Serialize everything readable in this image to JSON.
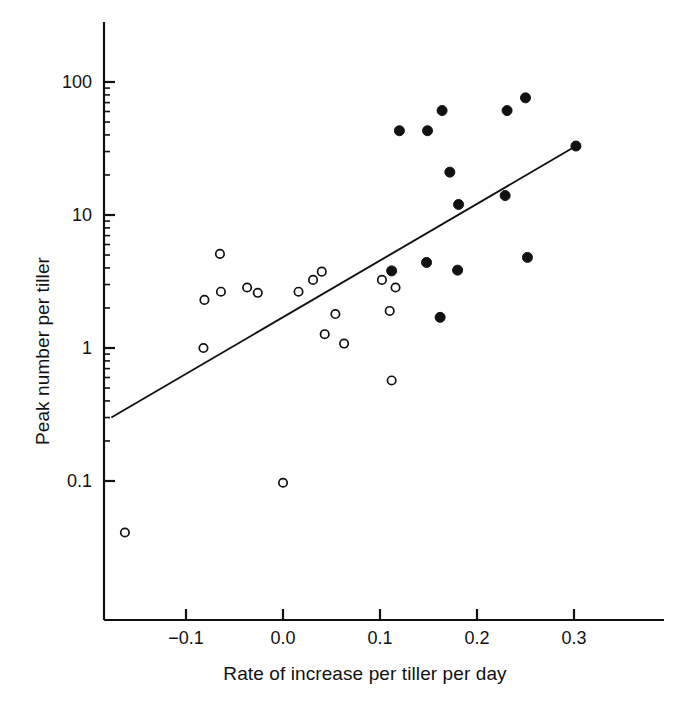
{
  "chart_data": {
    "type": "scatter",
    "title": "",
    "subtitle": "",
    "xlabel": "Rate of increase per tiller per day",
    "ylabel": "Peak number per tiller",
    "xscale": "linear",
    "yscale": "log",
    "xlim": [
      -0.18,
      0.325
    ],
    "ylim": [
      0.025,
      200
    ],
    "grid": false,
    "legend": "none",
    "xticks": [
      -0.1,
      0.0,
      0.1,
      0.2,
      0.3
    ],
    "xticklabels": [
      "−0.1",
      "0.0",
      "0.1",
      "0.2",
      "0.3"
    ],
    "yticks": [
      0.1,
      1,
      10,
      100
    ],
    "yticklabels": [
      "0.1",
      "1",
      "10",
      "100"
    ],
    "yminorticks": [
      0.2,
      0.3,
      0.4,
      0.5,
      0.6,
      0.7,
      0.8,
      0.9,
      2,
      3,
      4,
      5,
      6,
      7,
      8,
      9,
      20,
      30,
      40,
      50,
      60,
      70,
      80,
      90
    ],
    "series": [
      {
        "name": "open circles",
        "marker": "open-circle",
        "color": "#111111",
        "points": [
          {
            "x": -0.163,
            "y": 0.041
          },
          {
            "x": -0.082,
            "y": 1.0
          },
          {
            "x": -0.081,
            "y": 2.3
          },
          {
            "x": -0.065,
            "y": 5.1
          },
          {
            "x": -0.064,
            "y": 2.65
          },
          {
            "x": -0.037,
            "y": 2.85
          },
          {
            "x": -0.026,
            "y": 2.6
          },
          {
            "x": 0.0,
            "y": 0.097
          },
          {
            "x": 0.016,
            "y": 2.65
          },
          {
            "x": 0.031,
            "y": 3.25
          },
          {
            "x": 0.04,
            "y": 3.75
          },
          {
            "x": 0.043,
            "y": 1.27
          },
          {
            "x": 0.054,
            "y": 1.8
          },
          {
            "x": 0.063,
            "y": 1.08
          },
          {
            "x": 0.102,
            "y": 3.25
          },
          {
            "x": 0.11,
            "y": 1.9
          },
          {
            "x": 0.112,
            "y": 0.57
          },
          {
            "x": 0.116,
            "y": 2.85
          }
        ]
      },
      {
        "name": "filled circles",
        "marker": "filled-circle",
        "color": "#111111",
        "points": [
          {
            "x": 0.112,
            "y": 3.8
          },
          {
            "x": 0.12,
            "y": 43.0
          },
          {
            "x": 0.148,
            "y": 4.4
          },
          {
            "x": 0.149,
            "y": 43.0
          },
          {
            "x": 0.162,
            "y": 1.7
          },
          {
            "x": 0.164,
            "y": 61.0
          },
          {
            "x": 0.172,
            "y": 21.0
          },
          {
            "x": 0.18,
            "y": 3.85
          },
          {
            "x": 0.181,
            "y": 12.0
          },
          {
            "x": 0.229,
            "y": 14.0
          },
          {
            "x": 0.231,
            "y": 61.0
          },
          {
            "x": 0.25,
            "y": 76.0
          },
          {
            "x": 0.252,
            "y": 4.8
          },
          {
            "x": 0.302,
            "y": 33.0
          }
        ]
      }
    ],
    "fit_line": {
      "name": "regression-line",
      "x_start": -0.177,
      "y_start": 0.3,
      "x_end": 0.302,
      "y_end": 33.0
    }
  }
}
